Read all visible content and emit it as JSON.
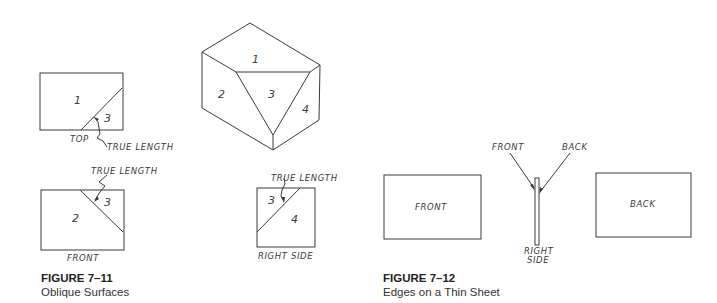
{
  "figure_7_11": {
    "caption_number": "FIGURE 7–11",
    "caption_title": "Oblique Surfaces",
    "isometric": {
      "faces": [
        "1",
        "2",
        "3",
        "4"
      ]
    },
    "top_view": {
      "label": "TOP",
      "faces": [
        "1",
        "3"
      ],
      "annotation": "TRUE LENGTH"
    },
    "front_view": {
      "label": "FRONT",
      "faces": [
        "2",
        "3"
      ],
      "annotation": "TRUE LENGTH"
    },
    "right_side_view": {
      "label": "RIGHT SIDE",
      "faces": [
        "3",
        "4"
      ],
      "annotation": "TRUE LENGTH"
    }
  },
  "figure_7_12": {
    "caption_number": "FIGURE 7–12",
    "caption_title": "Edges on a Thin Sheet",
    "front_view": {
      "label": "FRONT"
    },
    "back_view": {
      "label": "BACK"
    },
    "right_side_view": {
      "label_line1": "RIGHT",
      "label_line2": "SIDE",
      "leader_front": "FRONT",
      "leader_back": "BACK"
    }
  }
}
